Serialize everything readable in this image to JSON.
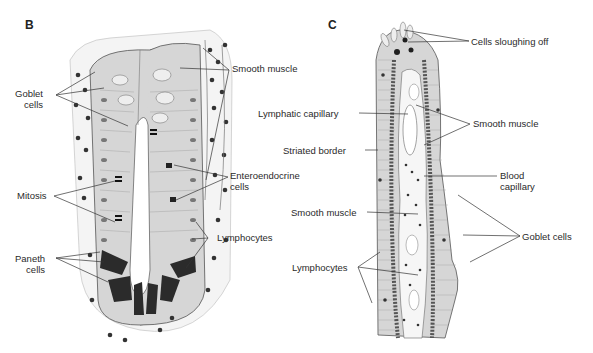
{
  "panels": {
    "B": {
      "letter": "B",
      "labels": {
        "goblet": [
          "Goblet",
          "cells"
        ],
        "smooth_muscle": "Smooth muscle",
        "mitosis": "Mitosis",
        "enteroendocrine": [
          "Enteroendocrine",
          "cells"
        ],
        "paneth": [
          "Paneth",
          "cells"
        ],
        "lymphocytes": "Lymphocytes"
      }
    },
    "C": {
      "letter": "C",
      "labels": {
        "sloughing": "Cells sloughing off",
        "lymphatic_capillary": "Lymphatic capillary",
        "smooth_muscle_upper": "Smooth muscle",
        "striated_border": "Striated border",
        "blood_capillary": [
          "Blood",
          "capillary"
        ],
        "smooth_muscle_lower": "Smooth muscle",
        "goblet": "Goblet cells",
        "lymphocytes": "Lymphocytes"
      }
    }
  },
  "colors": {
    "line": "#333333",
    "epithelium": "#d6d6d6",
    "nucleus": "#3a3a3a",
    "background": "#ffffff"
  }
}
